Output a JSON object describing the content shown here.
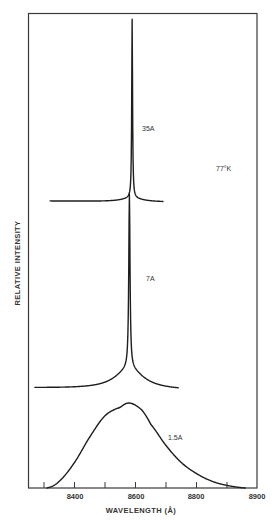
{
  "chart_data": {
    "type": "line",
    "title": "",
    "xlabel": "WAVELENGTH (Å)",
    "ylabel": "RELATIVE INTENSITY",
    "xlim": [
      8250,
      9000
    ],
    "x_tick_values": [
      8300,
      8400,
      8500,
      8600,
      8700,
      8800,
      8900
    ],
    "x_tick_labels": [
      {
        "label": "8400",
        "x": 8400
      },
      {
        "label": "8600",
        "x": 8600
      },
      {
        "label": "8800",
        "x": 8800
      },
      {
        "label": "8900",
        "x": 9000
      }
    ],
    "grid": false,
    "annotations": [
      {
        "text": "77°K",
        "note": "temperature"
      }
    ],
    "series": [
      {
        "name": "35A",
        "label": "35A",
        "peak_wavelength": 8590,
        "shape": "very narrow line (stacked offset trace, top)",
        "x_range": [
          8320,
          8690
        ],
        "points": [
          [
            8320,
            0.0
          ],
          [
            8400,
            0.01
          ],
          [
            8500,
            0.03
          ],
          [
            8560,
            0.06
          ],
          [
            8580,
            0.2
          ],
          [
            8588,
            1.0
          ],
          [
            8596,
            0.2
          ],
          [
            8610,
            0.06
          ],
          [
            8650,
            0.02
          ],
          [
            8690,
            0.0
          ]
        ]
      },
      {
        "name": "7A",
        "label": "7A",
        "peak_wavelength": 8580,
        "shape": "narrow line with broad wings (stacked offset trace, middle)",
        "x_range": [
          8270,
          8740
        ],
        "points": [
          [
            8270,
            0.0
          ],
          [
            8400,
            0.02
          ],
          [
            8480,
            0.08
          ],
          [
            8530,
            0.25
          ],
          [
            8560,
            0.5
          ],
          [
            8575,
            1.0
          ],
          [
            8590,
            0.5
          ],
          [
            8620,
            0.22
          ],
          [
            8660,
            0.08
          ],
          [
            8740,
            0.0
          ]
        ]
      },
      {
        "name": "1.5A",
        "label": "1.5A",
        "peak_wavelength": 8580,
        "shape": "broad asymmetric band (bottom trace)",
        "x_range": [
          8310,
          8960
        ],
        "points": [
          [
            8310,
            0.0
          ],
          [
            8350,
            0.08
          ],
          [
            8400,
            0.3
          ],
          [
            8450,
            0.6
          ],
          [
            8500,
            0.85
          ],
          [
            8550,
            0.95
          ],
          [
            8580,
            1.0
          ],
          [
            8620,
            0.92
          ],
          [
            8650,
            0.75
          ],
          [
            8700,
            0.5
          ],
          [
            8750,
            0.3
          ],
          [
            8800,
            0.17
          ],
          [
            8850,
            0.08
          ],
          [
            8900,
            0.03
          ],
          [
            8960,
            0.0
          ]
        ]
      }
    ]
  },
  "labels": {
    "x_axis": "WAVELENGTH (Å)",
    "y_axis": "RELATIVE INTENSITY",
    "temperature": "77°K",
    "trace_35A": "35A",
    "trace_7A": "7A",
    "trace_1_5A": "1.5A",
    "tick_8400": "8400",
    "tick_8600": "8600",
    "tick_8800": "8800",
    "tick_8900": "8900"
  }
}
